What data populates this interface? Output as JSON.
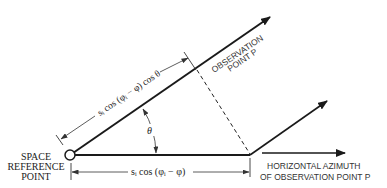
{
  "diagram": {
    "type": "geometry-projection",
    "labels": {
      "space_reference_line1": "SPACE",
      "space_reference_line2": "REFERENCE",
      "space_reference_line3": "POINT",
      "observation_line1": "OBSERVATION",
      "observation_line2": "POINT P",
      "horizontal_line1": "HORIZONTAL AZIMUTH",
      "horizontal_line2": "OF OBSERVATION POINT P",
      "slant_dimension": "sᵢ cos (φᵢ − φ) cos θ",
      "horizontal_dimension": "sᵢ cos (φᵢ − φ)",
      "angle": "θ"
    },
    "colors": {
      "line": "#1a1a1a",
      "dim_line": "#444444",
      "background": "#ffffff"
    }
  }
}
